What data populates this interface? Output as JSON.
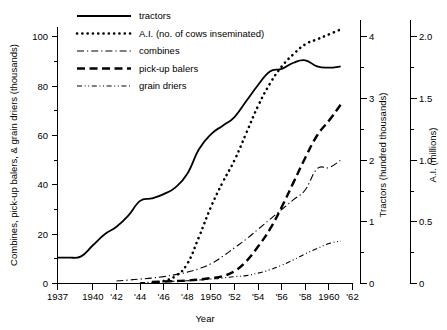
{
  "chart_data": {
    "type": "line",
    "title": "",
    "xlabel": "Year",
    "ylabel": "Combines, pick-up balers, & grain driers  (thousands)",
    "ylabel_right_1": "Tractors  (hundred thousands)",
    "ylabel_right_2": "A.I.  (millions)",
    "grid": false,
    "legend_position": "top-left-inside",
    "x": [
      1937,
      1938,
      1939,
      1940,
      1941,
      1942,
      1943,
      1944,
      1945,
      1946,
      1947,
      1948,
      1949,
      1950,
      1951,
      1952,
      1953,
      1954,
      1955,
      1956,
      1957,
      1958,
      1959,
      1960,
      1961
    ],
    "xlim": [
      1937,
      1962
    ],
    "x_tick_values": [
      1937,
      1940,
      1942,
      1944,
      1946,
      1948,
      1950,
      1952,
      1954,
      1956,
      1958,
      1960,
      1962
    ],
    "x_tick_labels": [
      "1937",
      "1940",
      "'42",
      "'44",
      "'46",
      "'48",
      "1950",
      "'52",
      "'54",
      "'56",
      "'58",
      "1960",
      "'62"
    ],
    "x_minor_tick_values": [
      1938,
      1939,
      1941,
      1943,
      1945,
      1947,
      1949,
      1951,
      1953,
      1955,
      1957,
      1959,
      1961
    ],
    "left_axis": {
      "label": "Combines, pick-up balers, & grain driers  (thousands)",
      "lim": [
        0,
        104
      ],
      "tick_values": [
        0,
        20,
        40,
        60,
        80,
        100
      ],
      "tick_labels": [
        "0",
        "20",
        "40",
        "60",
        "80",
        "100"
      ],
      "minor_tick_values": [
        10,
        30,
        50,
        70,
        90
      ]
    },
    "right_axis_1": {
      "label": "Tractors  (hundred thousands)",
      "lim": [
        0,
        4.16
      ],
      "tick_values": [
        0,
        1,
        2,
        3,
        4
      ],
      "tick_labels": [
        "0",
        "1",
        "2",
        "3",
        "4"
      ],
      "minor_tick_values": [
        0.5,
        1.5,
        2.5,
        3.5
      ]
    },
    "right_axis_2": {
      "label": "A.I.  (millions)",
      "lim": [
        0,
        2.08
      ],
      "tick_values": [
        0,
        0.5,
        1.0,
        1.5,
        2.0
      ],
      "tick_labels": [
        "0",
        "0.5",
        "1.0",
        "1.5",
        "2.0"
      ],
      "minor_tick_values": [
        0.25,
        0.75,
        1.25,
        1.75
      ]
    },
    "series": [
      {
        "name": "tractors",
        "key": "tractors",
        "axis": "right_axis_1",
        "units": "hundred thousands",
        "dash": "solid",
        "line_width": 1.8,
        "values": [
          0.42,
          0.42,
          0.44,
          0.62,
          0.8,
          0.92,
          1.1,
          1.34,
          1.38,
          1.45,
          1.56,
          1.78,
          2.18,
          2.42,
          2.56,
          2.7,
          2.96,
          3.22,
          3.44,
          3.48,
          3.58,
          3.62,
          3.52,
          3.5,
          3.52
        ]
      },
      {
        "name": "A.I. (no. of cows inseminated)",
        "key": "ai",
        "axis": "right_axis_2",
        "units": "millions",
        "dash": "dotted",
        "line_width": 2.6,
        "values": [
          null,
          null,
          null,
          null,
          null,
          null,
          null,
          null,
          null,
          0.02,
          0.06,
          0.16,
          0.38,
          0.62,
          0.82,
          1.0,
          1.22,
          1.44,
          1.62,
          1.76,
          1.86,
          1.94,
          1.98,
          2.02,
          2.06
        ]
      },
      {
        "name": "combines",
        "key": "combines",
        "axis": "left_axis",
        "units": "thousands",
        "dash": "dash-dot",
        "line_width": 1.1,
        "values": [
          null,
          null,
          null,
          null,
          null,
          1.0,
          1.4,
          1.8,
          2.2,
          2.8,
          3.6,
          4.6,
          6.0,
          8.0,
          11.0,
          14.5,
          18.0,
          22.0,
          26.0,
          30.0,
          34.0,
          38.0,
          46.5,
          47.0,
          50.0
        ]
      },
      {
        "name": "pick-up balers",
        "key": "balers",
        "axis": "left_axis",
        "units": "thousands",
        "dash": "dashed",
        "line_width": 2.4,
        "values": [
          null,
          null,
          null,
          null,
          null,
          null,
          null,
          null,
          0.6,
          0.8,
          1.0,
          1.2,
          1.6,
          2.2,
          3.0,
          5.0,
          9.0,
          15.0,
          22.0,
          31.0,
          41.0,
          51.0,
          60.0,
          66.0,
          72.5
        ]
      },
      {
        "name": "grain driers",
        "key": "driers",
        "axis": "left_axis",
        "units": "thousands",
        "dash": "dash-dot-dot",
        "line_width": 1.1,
        "values": [
          null,
          null,
          null,
          null,
          null,
          null,
          null,
          0.4,
          0.5,
          0.7,
          0.9,
          1.1,
          1.4,
          1.8,
          2.2,
          2.8,
          3.2,
          4.2,
          5.6,
          7.4,
          9.6,
          12.0,
          14.2,
          16.2,
          17.2
        ]
      }
    ]
  },
  "legend": {
    "items": [
      {
        "label": "tractors",
        "style": "solid"
      },
      {
        "label": "A.I. (no. of cows inseminated)",
        "style": "dotted"
      },
      {
        "label": "combines",
        "style": "dash-dot"
      },
      {
        "label": "pick-up balers",
        "style": "dashed"
      },
      {
        "label": "grain driers",
        "style": "dash-dot-dot"
      }
    ]
  },
  "colors": {
    "ink": "#000000",
    "background": "#ffffff"
  }
}
